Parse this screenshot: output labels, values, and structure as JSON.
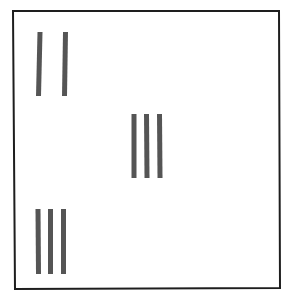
{
  "diagram": {
    "colors": {
      "background": "#ffffff",
      "frame": "#1e1e1e",
      "bar": "#555555"
    },
    "frame": {
      "points": [
        [
          13,
          11
        ],
        [
          279,
          11
        ],
        [
          280,
          288
        ],
        [
          15,
          289
        ]
      ],
      "stroke_width": 2
    },
    "groups": [
      {
        "name": "top-left-group",
        "count": 2,
        "bars": [
          {
            "x1": 40,
            "y1": 32,
            "x2": 38.5,
            "y2": 96,
            "width": 5
          },
          {
            "x1": 65.5,
            "y1": 32,
            "x2": 64.5,
            "y2": 96,
            "width": 5
          }
        ]
      },
      {
        "name": "center-group",
        "count": 3,
        "bars": [
          {
            "x1": 134,
            "y1": 114,
            "x2": 134,
            "y2": 178,
            "width": 5
          },
          {
            "x1": 146.5,
            "y1": 114,
            "x2": 147,
            "y2": 178,
            "width": 5
          },
          {
            "x1": 159.5,
            "y1": 114,
            "x2": 160,
            "y2": 178,
            "width": 5
          }
        ]
      },
      {
        "name": "bottom-left-group",
        "count": 3,
        "bars": [
          {
            "x1": 38,
            "y1": 209,
            "x2": 38.5,
            "y2": 274,
            "width": 5
          },
          {
            "x1": 50.5,
            "y1": 209,
            "x2": 50.5,
            "y2": 274,
            "width": 5
          },
          {
            "x1": 63.5,
            "y1": 209,
            "x2": 63.5,
            "y2": 274,
            "width": 5
          }
        ]
      }
    ]
  }
}
